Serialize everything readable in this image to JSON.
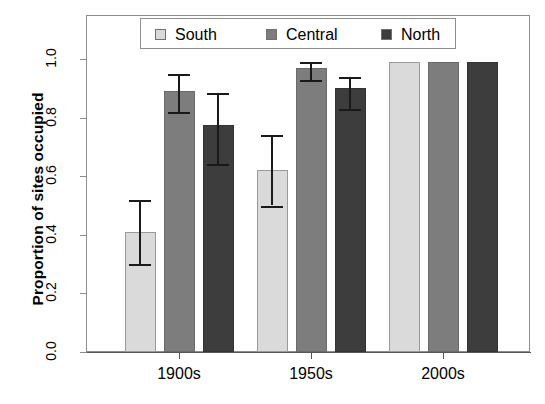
{
  "chart_data": {
    "type": "bar",
    "title": "",
    "subtitle": "",
    "xlabel": "",
    "ylabel": "Proportion of sites occupied",
    "categories": [
      "1900s",
      "1950s",
      "2000s"
    ],
    "ylim": [
      0.0,
      1.0
    ],
    "yticks": [
      "0.0",
      "0.2",
      "0.4",
      "0.6",
      "0.8",
      "1.0"
    ],
    "ytick_values": [
      0.0,
      0.2,
      0.4,
      0.6,
      0.8,
      1.0
    ],
    "grid": false,
    "legend_position": "top-inside",
    "error_bars": "upper and lower whiskers with caps",
    "series": [
      {
        "name": "South",
        "color": "#dadada",
        "values": [
          0.41,
          0.62,
          0.99
        ],
        "err_low": [
          0.3,
          0.5,
          null
        ],
        "err_high": [
          0.52,
          0.74,
          null
        ]
      },
      {
        "name": "Central",
        "color": "#7d7d7d",
        "values": [
          0.89,
          0.97,
          0.99
        ],
        "err_low": [
          0.82,
          0.93,
          null
        ],
        "err_high": [
          0.95,
          0.99,
          null
        ]
      },
      {
        "name": "North",
        "color": "#3d3d3d",
        "values": [
          0.775,
          0.9,
          0.99
        ],
        "err_low": [
          0.64,
          0.83,
          null
        ],
        "err_high": [
          0.885,
          0.94,
          null
        ]
      }
    ]
  },
  "axis": {
    "y_title": "Proportion of sites occupied",
    "y_tick_labels": [
      "0.0",
      "0.2",
      "0.4",
      "0.6",
      "0.8",
      "1.0"
    ],
    "x_tick_labels": [
      "1900s",
      "1950s",
      "2000s"
    ]
  },
  "legend": {
    "items": [
      {
        "label": "South",
        "color": "#dadada"
      },
      {
        "label": "Central",
        "color": "#7d7d7d"
      },
      {
        "label": "North",
        "color": "#3d3d3d"
      }
    ]
  },
  "top_sliver": {
    "text": ""
  }
}
